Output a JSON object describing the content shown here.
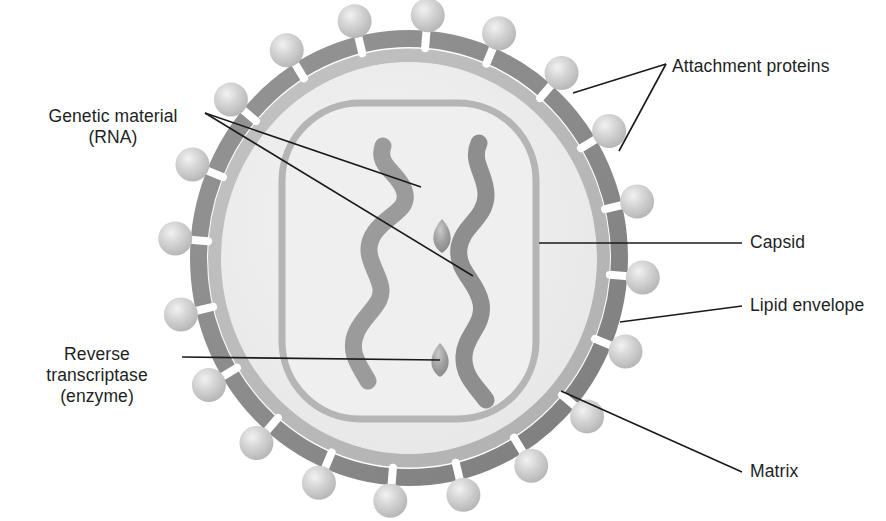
{
  "figure": {
    "background_color": "#ffffff",
    "palette": {
      "envelope_dark": "#8d8d8d",
      "envelope_dark_edge": "#7b7b7b",
      "matrix_gray": "#b9b9b9",
      "interior_light": "#eeeeee",
      "capsid_outline": "#b5b5b5",
      "rna_strand": "#9a9a9a",
      "rna_strand_dark": "#868686",
      "enzyme_oval": "#9a9a9a",
      "spike_sphere": "#cfcfcf",
      "spike_stalk": "#ffffff",
      "leader_line": "#1a1a1a",
      "text": "#221f1f"
    }
  },
  "labels": [
    {
      "id": "attachment-proteins",
      "text": "Attachment proteins",
      "x": 672,
      "y": 56,
      "align": "left",
      "lines": [
        {
          "x1": 666,
          "y1": 64,
          "x2": 573,
          "y2": 93
        },
        {
          "x1": 666,
          "y1": 64,
          "x2": 619,
          "y2": 151
        }
      ]
    },
    {
      "id": "genetic-material",
      "text": "Genetic material\n(RNA)",
      "x": 18,
      "y": 108,
      "align": "center",
      "lines": [
        {
          "x1": 205,
          "y1": 113,
          "x2": 421,
          "y2": 187
        },
        {
          "x1": 205,
          "y1": 113,
          "x2": 473,
          "y2": 276
        }
      ]
    },
    {
      "id": "capsid",
      "text": "Capsid",
      "x": 748,
      "y": 233,
      "align": "left",
      "lines": [
        {
          "x1": 742,
          "y1": 243,
          "x2": 539,
          "y2": 243
        }
      ]
    },
    {
      "id": "lipid-envelope",
      "text": "Lipid envelope",
      "x": 748,
      "y": 296,
      "align": "left",
      "lines": [
        {
          "x1": 742,
          "y1": 306,
          "x2": 620,
          "y2": 322
        }
      ]
    },
    {
      "id": "reverse-transcriptase",
      "text": "Reverse\ntranscriptase\n(enzyme)",
      "x": 18,
      "y": 345,
      "align": "center",
      "lines": [
        {
          "x1": 182,
          "y1": 357,
          "x2": 440,
          "y2": 360
        }
      ]
    },
    {
      "id": "matrix",
      "text": "Matrix",
      "x": 748,
      "y": 462,
      "align": "left",
      "lines": [
        {
          "x1": 742,
          "y1": 472,
          "x2": 561,
          "y2": 391
        }
      ]
    }
  ],
  "structures": {
    "envelope": {
      "name": "lipid-envelope",
      "cx": 409,
      "cy": 258,
      "rx": 219,
      "ry": 228,
      "band_width": 17
    },
    "matrix": {
      "name": "matrix",
      "cx": 409,
      "cy": 258,
      "rx": 201,
      "ry": 210,
      "band_width": 14
    },
    "capsid": {
      "name": "capsid",
      "x": 279,
      "y": 100,
      "width": 258,
      "height": 322,
      "radius": 78,
      "stroke_width": 7
    },
    "rna_strands": [
      {
        "name": "rna-strand-left"
      },
      {
        "name": "rna-strand-right"
      }
    ],
    "enzymes": [
      {
        "name": "reverse-transcriptase-upper",
        "cx": 442,
        "cy": 236,
        "rx": 11,
        "ry": 17
      },
      {
        "name": "reverse-transcriptase-lower",
        "cx": 440,
        "cy": 360,
        "rx": 11,
        "ry": 17
      }
    ],
    "spike_count": 20,
    "spike_radius": 17,
    "spike_stalk_length": 15
  }
}
